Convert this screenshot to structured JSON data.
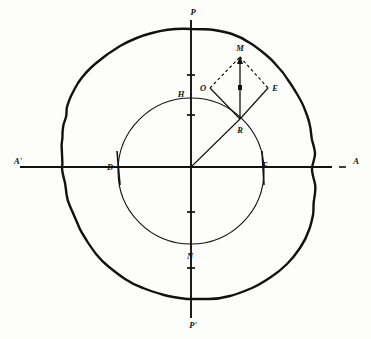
{
  "figure": {
    "background_color": "#fdfdfc",
    "ink_color": "#111111"
  },
  "axes": {
    "horizontal": {
      "left_label": "A'",
      "right_label": "A",
      "right_prefix_dash": "—",
      "y": 167,
      "x_start": 20,
      "x_end": 348
    },
    "vertical": {
      "top_label": "P",
      "bottom_label": "P'",
      "x": 191,
      "y_start": 20,
      "y_end": 318
    },
    "origin": {
      "x": 191,
      "y": 167
    }
  },
  "circle": {
    "center_label": "",
    "cx": 191,
    "cy": 171,
    "r": 73,
    "intersections": [
      {
        "name": "D",
        "label": "D",
        "x": 110,
        "y": 167
      },
      {
        "name": "E_axis",
        "label": "E",
        "x": 265,
        "y": 166
      },
      {
        "name": "H",
        "label": "H",
        "x": 181,
        "y": 94
      },
      {
        "name": "N",
        "label": "N",
        "x": 190,
        "y": 256
      }
    ]
  },
  "vector_figure": {
    "points": [
      {
        "name": "M",
        "label": "M",
        "x": 240,
        "y": 57,
        "label_x": 240,
        "label_y": 48
      },
      {
        "name": "O",
        "label": "O",
        "x": 210,
        "y": 88,
        "label_x": 204,
        "label_y": 90
      },
      {
        "name": "E",
        "label": "E",
        "x": 268,
        "y": 88,
        "label_x": 274,
        "label_y": 90
      },
      {
        "name": "R",
        "label": "R",
        "x": 240,
        "y": 119,
        "label_x": 240,
        "label_y": 131
      }
    ],
    "solid_edges": [
      "R-O",
      "R-E",
      "R-M"
    ],
    "dashed_edges": [
      "O-M",
      "E-M"
    ],
    "arrow_on": "R-M"
  },
  "tick_marks": {
    "vertical_axis_y": [
      75,
      115,
      212,
      268
    ],
    "horizontal_axis_note": "circle crossings marked by short strokes"
  },
  "blob": {
    "description": "irregular hand-drawn closed outline enclosing the circle",
    "stroke_width": 2.4
  }
}
